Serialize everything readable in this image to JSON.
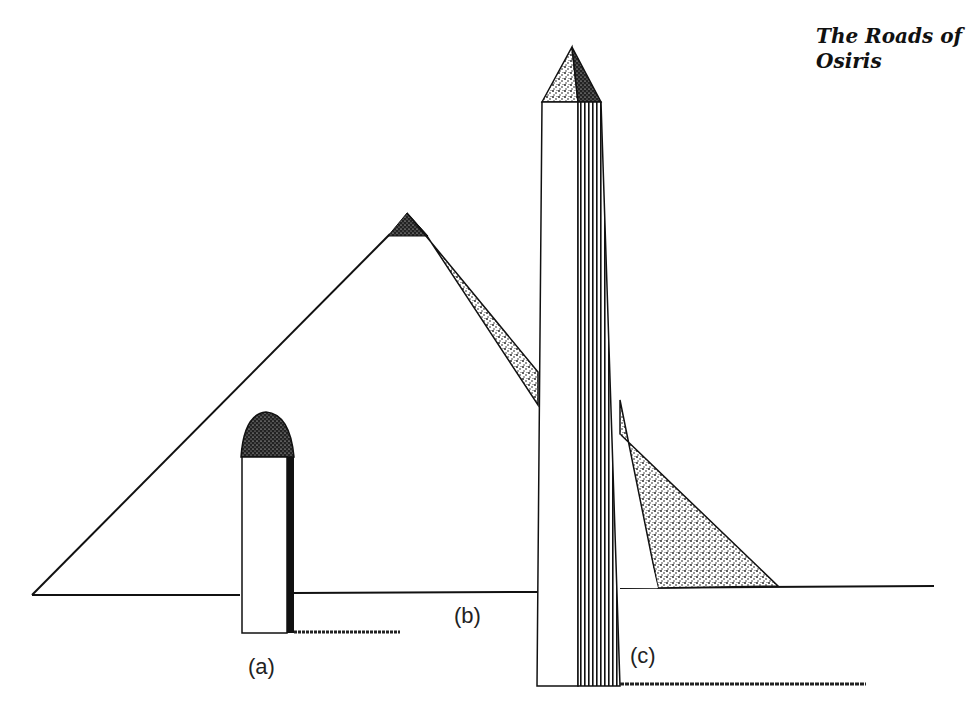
{
  "figure": {
    "title_line1": "The Roads of",
    "title_line2": "Osiris",
    "labels": {
      "a": "(a)",
      "b": "(b)",
      "c": "(c)"
    },
    "objects": [
      {
        "id": "a",
        "description": "small pillar with dome-shaped shaded top and shadow to the right"
      },
      {
        "id": "b",
        "description": "pyramid with shaded shadow band cast to the right"
      },
      {
        "id": "c",
        "description": "tall obelisk with pyramidion top, fluted shaded right face and long ground shadow"
      }
    ],
    "colors": {
      "ink": "#111111",
      "background": "#ffffff"
    }
  }
}
